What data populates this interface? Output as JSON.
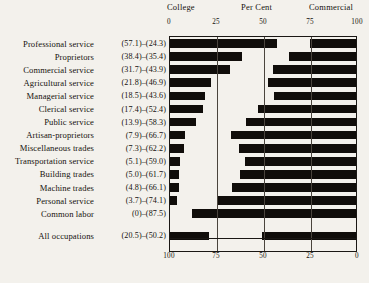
{
  "header": {
    "left_label": "College",
    "center_label": "Per Cent",
    "right_label": "Commercial"
  },
  "axis": {
    "top_ticks": [
      "0",
      "25",
      "50",
      "75",
      "100"
    ],
    "bottom_ticks": [
      "100",
      "75",
      "50",
      "25",
      "0"
    ]
  },
  "footer": {
    "text": ""
  },
  "chart_data": {
    "type": "bar",
    "title": "Per Cent",
    "subtitle": "",
    "xlabel": "Per Cent",
    "ylabel": "",
    "xlim": [
      0,
      100
    ],
    "grid": true,
    "legend_position": "top",
    "orientation": "horizontal",
    "bar_origin_note": "College bars measured left-to-right from 0; Commercial bars measured right-to-left from 100",
    "top_axis_ticks": [
      0,
      25,
      50,
      75,
      100
    ],
    "bottom_axis_ticks": [
      100,
      75,
      50,
      25,
      0
    ],
    "categories": [
      "Professional service",
      "Proprietors",
      "Commercial service",
      "Agricultural service",
      "Managerial service",
      "Clerical service",
      "Public service",
      "Artisan-proprietors",
      "Miscellaneous trades",
      "Transportation service",
      "Building trades",
      "Machine trades",
      "Personal service",
      "Common labor",
      "All occupations"
    ],
    "series": [
      {
        "name": "College",
        "values": [
          57.1,
          38.4,
          31.7,
          21.8,
          18.5,
          17.4,
          13.9,
          7.9,
          7.3,
          5.1,
          5.0,
          4.8,
          3.7,
          0,
          20.5
        ]
      },
      {
        "name": "Commercial",
        "values": [
          24.3,
          35.4,
          43.9,
          46.9,
          43.6,
          52.4,
          58.3,
          66.7,
          62.2,
          59.0,
          61.7,
          66.1,
          74.1,
          87.5,
          50.2
        ]
      }
    ],
    "rows": [
      {
        "label": "Professional service",
        "college": "57.1",
        "commercial": "24.3",
        "value_text": "(57.1)–(24.3)",
        "separated": false
      },
      {
        "label": "Proprietors",
        "college": "38.4",
        "commercial": "35.4",
        "value_text": "(38.4)–(35.4)",
        "separated": false
      },
      {
        "label": "Commercial service",
        "college": "31.7",
        "commercial": "43.9",
        "value_text": "(31.7)–(43.9)",
        "separated": false
      },
      {
        "label": "Agricultural service",
        "college": "21.8",
        "commercial": "46.9",
        "value_text": "(21.8)–(46.9)",
        "separated": false
      },
      {
        "label": "Managerial service",
        "college": "18.5",
        "commercial": "43.6",
        "value_text": "(18.5)–(43.6)",
        "separated": false
      },
      {
        "label": "Clerical service",
        "college": "17.4",
        "commercial": "52.4",
        "value_text": "(17.4)–(52.4)",
        "separated": false
      },
      {
        "label": "Public service",
        "college": "13.9",
        "commercial": "58.3",
        "value_text": "(13.9)–(58.3)",
        "separated": false
      },
      {
        "label": "Artisan-proprietors",
        "college": "7.9",
        "commercial": "66.7",
        "value_text": "(7.9)–(66.7)",
        "separated": false
      },
      {
        "label": "Miscellaneous trades",
        "college": "7.3",
        "commercial": "62.2",
        "value_text": "(7.3)–(62.2)",
        "separated": false
      },
      {
        "label": "Transportation service",
        "college": "5.1",
        "commercial": "59.0",
        "value_text": "(5.1)–(59.0)",
        "separated": false
      },
      {
        "label": "Building trades",
        "college": "5.0",
        "commercial": "61.7",
        "value_text": "(5.0)–(61.7)",
        "separated": false
      },
      {
        "label": "Machine trades",
        "college": "4.8",
        "commercial": "66.1",
        "value_text": "(4.8)–(66.1)",
        "separated": false
      },
      {
        "label": "Personal service",
        "college": "3.7",
        "commercial": "74.1",
        "value_text": "(3.7)–(74.1)",
        "separated": false
      },
      {
        "label": "Common labor",
        "college": "0",
        "commercial": "87.5",
        "value_text": "(0)–(87.5)",
        "separated": false
      },
      {
        "label": "All occupations",
        "college": "20.5",
        "commercial": "50.2",
        "value_text": "(20.5)–(50.2)",
        "separated": true
      }
    ]
  }
}
